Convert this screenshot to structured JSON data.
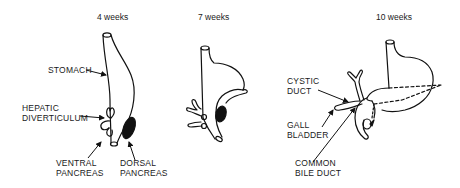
{
  "panels": [
    {
      "title": "4 weeks",
      "labels": {
        "stomach": "STOMACH",
        "hepatic_1": "HEPATIC",
        "hepatic_2": "DIVERTICULUM",
        "ventral_1": "VENTRAL",
        "ventral_2": "PANCREAS",
        "dorsal_1": "DORSAL",
        "dorsal_2": "PANCREAS"
      }
    },
    {
      "title": "7 weeks",
      "labels": {}
    },
    {
      "title": "10 weeks",
      "labels": {
        "cystic_1": "CYSTIC",
        "cystic_2": "DUCT",
        "gall_1": "GALL",
        "gall_2": "BLADDER",
        "common_1": "COMMON",
        "common_2": "BILE DUCT"
      }
    }
  ],
  "colors": {
    "ink": "#111111",
    "background": "#ffffff"
  }
}
